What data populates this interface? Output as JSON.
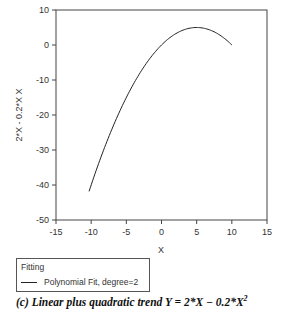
{
  "chart_data": {
    "type": "line",
    "title": "",
    "xlabel": "X",
    "ylabel": "2*X - 0.2*X X",
    "xlim": [
      -15,
      15
    ],
    "ylim": [
      -50,
      10
    ],
    "xticks": [
      -15,
      -10,
      -5,
      0,
      5,
      10,
      15
    ],
    "yticks": [
      -50,
      -40,
      -30,
      -20,
      -10,
      0,
      10
    ],
    "grid": false,
    "legend_position": "below-left",
    "series": [
      {
        "name": "Polynomial Fit, degree=2",
        "formula": "y = 2*x - 0.2*x^2",
        "x": [
          -10.3,
          -8,
          -6,
          -4,
          -2,
          0,
          2,
          4,
          5,
          6,
          8,
          10
        ],
        "y": [
          -41.8,
          -28.8,
          -19.2,
          -11.2,
          -4.8,
          0,
          3.2,
          4.8,
          5.0,
          4.8,
          3.2,
          0
        ],
        "color": "#222222"
      }
    ]
  },
  "legend": {
    "title": "Fitting",
    "items": [
      {
        "label": "Polynomial Fit, degree=2"
      }
    ]
  },
  "caption": {
    "prefix": "(c)  Linear plus quadratic trend ",
    "formula": "Y = 2*X − 0.2*X",
    "exponent": "2"
  }
}
